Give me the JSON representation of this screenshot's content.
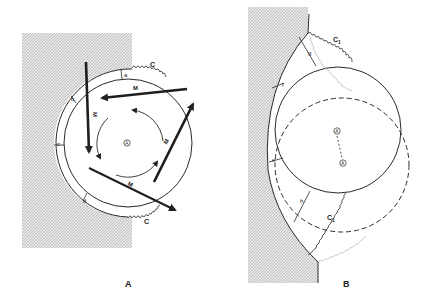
{
  "panels": [
    {
      "id": "A",
      "caption": "A",
      "labels": {
        "a": "a",
        "b": "b",
        "c": "c",
        "d": "d",
        "C_top": "C",
        "C_bottom": "C",
        "M_top": "M",
        "M_right": "M",
        "M_left": "M",
        "M_bottom": "M",
        "center": "A"
      }
    },
    {
      "id": "B",
      "caption": "B",
      "labels": {
        "e": "e",
        "f": "f",
        "g": "g",
        "h": "h",
        "C1_top": "C",
        "C1_top_sub": "1",
        "C1_bottom": "C",
        "C1_bottom_sub": "1",
        "center_solid": "A",
        "center_dashed": "A"
      }
    }
  ],
  "colors": {
    "ink": "#2a2a2a",
    "hatch_bg": "#e4e4e4",
    "hatch_line": "#bdbdbd",
    "faint": "#b8b8b8"
  }
}
